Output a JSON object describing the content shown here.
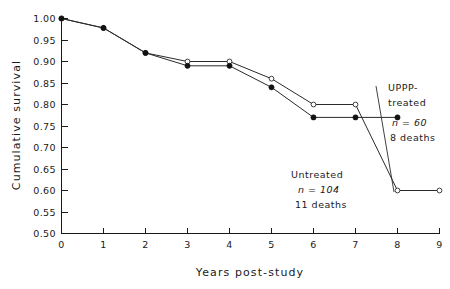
{
  "chart_data": {
    "type": "line",
    "title": "",
    "xlabel": "Years post-study",
    "ylabel": "Cumulative survival",
    "xlim": [
      0,
      9
    ],
    "ylim": [
      0.5,
      1.0
    ],
    "grid": false,
    "legend_position": "inline-annotations",
    "x_ticks": [
      "0",
      "1",
      "2",
      "3",
      "4",
      "5",
      "6",
      "7",
      "8",
      "9"
    ],
    "y_ticks": [
      "0.50",
      "0.55",
      "0.60",
      "0.65",
      "0.70",
      "0.75",
      "0.80",
      "0.85",
      "0.90",
      "0.95",
      "1.00"
    ],
    "series": [
      {
        "name": "UPPP-treated",
        "marker": "filled-circle",
        "x": [
          0,
          1,
          2,
          3,
          4,
          5,
          6,
          7,
          8
        ],
        "values": [
          1.0,
          0.978,
          0.92,
          0.89,
          0.89,
          0.84,
          0.77,
          0.77,
          0.77
        ]
      },
      {
        "name": "Untreated",
        "marker": "open-circle",
        "x": [
          0,
          1,
          2,
          3,
          4,
          5,
          6,
          7,
          8,
          9
        ],
        "values": [
          1.0,
          0.978,
          0.92,
          0.9,
          0.9,
          0.86,
          0.8,
          0.8,
          0.6,
          0.6
        ]
      }
    ],
    "annotations": [
      {
        "id": "uppp",
        "lines": [
          "UPPP-",
          "treated",
          "n = 60",
          "8 deaths"
        ],
        "label_line1": "UPPP-",
        "label_line2": "treated",
        "n_label": "n = 60",
        "deaths_label": "8 deaths"
      },
      {
        "id": "untreated",
        "lines": [
          "Untreated",
          "n = 104",
          "11 deaths"
        ],
        "label_line1": "Untreated",
        "n_label": "n = 104",
        "deaths_label": "11 deaths"
      }
    ]
  },
  "colors": {
    "ink": "#1a1a1a",
    "line": "#2a2a2a",
    "background": "#ffffff"
  }
}
